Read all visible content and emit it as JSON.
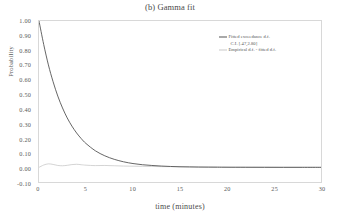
{
  "chart_data": {
    "type": "line",
    "title": "(b) Gamma fit",
    "xlabel": "time (minutes)",
    "ylabel": "Probability",
    "xlim": [
      0,
      30
    ],
    "ylim": [
      -0.1,
      1.0
    ],
    "grid": false,
    "legend_position": "top-right",
    "x_ticks": [
      "0",
      "5",
      "10",
      "15",
      "20",
      "25",
      "30"
    ],
    "x_tick_values": [
      0,
      5,
      10,
      15,
      20,
      25,
      30
    ],
    "y_ticks": [
      "1.00",
      "0.90",
      "0.80",
      "0.70",
      "0.60",
      "0.50",
      "0.40",
      "0.30",
      "0.20",
      "0.10",
      "0.00",
      "-0.10"
    ],
    "y_tick_values": [
      1.0,
      0.9,
      0.8,
      0.7,
      0.6,
      0.5,
      0.4,
      0.3,
      0.2,
      0.1,
      0.0,
      -0.1
    ],
    "x": [
      0,
      0.5,
      1,
      1.5,
      2,
      2.5,
      3,
      3.5,
      4,
      4.5,
      5,
      6,
      7,
      8,
      9,
      10,
      11,
      12,
      13,
      14,
      15,
      16,
      17,
      18,
      19,
      20,
      22,
      24,
      26,
      28,
      30
    ],
    "series": [
      {
        "name": "Fitted exceedance d.f.",
        "color": "#555555",
        "values": [
          1.0,
          0.84,
          0.7,
          0.585,
          0.487,
          0.406,
          0.338,
          0.282,
          0.235,
          0.196,
          0.163,
          0.113,
          0.079,
          0.055,
          0.038,
          0.026,
          0.018,
          0.013,
          0.009,
          0.006,
          0.004,
          0.003,
          0.002,
          0.0015,
          0.001,
          0.0007,
          0.0004,
          0.0002,
          0.0001,
          0.0001,
          0.0
        ]
      },
      {
        "name": "Empirical d.f. - fitted d.f.",
        "color": "#c9c9c9",
        "values": [
          0.0,
          0.016,
          0.024,
          0.02,
          0.013,
          0.011,
          0.014,
          0.019,
          0.021,
          0.018,
          0.015,
          0.012,
          0.013,
          0.011,
          0.009,
          0.008,
          0.007,
          0.006,
          0.005,
          0.005,
          0.004,
          0.004,
          0.003,
          0.003,
          0.003,
          0.002,
          0.002,
          0.002,
          0.001,
          0.001,
          0.001
        ]
      }
    ],
    "legend": [
      {
        "label": "Fitted exceedance d.f.",
        "color": "#555555",
        "swatch": true
      },
      {
        "label": "C.I. [.47,2.80]",
        "color": "#555555",
        "swatch": false
      },
      {
        "label": "Empirical d.f. - fitted d.f.",
        "color": "#c9c9c9",
        "swatch": true
      }
    ]
  }
}
